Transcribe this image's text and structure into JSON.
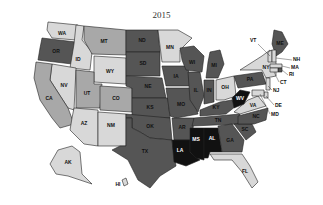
{
  "title": "2015",
  "legend_levels": {
    "black": "#111111",
    "dark": "#555555",
    "medium": "#a8a8a8",
    "light": "#d8d8d8"
  },
  "states": [
    {
      "abbr": "WA",
      "shade": "light",
      "poly": "48,22 78,25 76,40 52,38 47,30",
      "lx": 62,
      "ly": 34
    },
    {
      "abbr": "OR",
      "shade": "dark",
      "poly": "42,38 76,42 72,64 38,60 40,48",
      "lx": 56,
      "ly": 52
    },
    {
      "abbr": "ID",
      "shade": "light",
      "poly": "76,25 84,26 82,40 92,52 90,70 70,68 74,44",
      "lx": 78,
      "ly": 60
    },
    {
      "abbr": "MT",
      "shade": "medium",
      "poly": "84,26 126,30 126,55 92,54 84,40",
      "lx": 104,
      "ly": 42
    },
    {
      "abbr": "WY",
      "shade": "light",
      "poly": "94,56 126,58 126,84 94,82",
      "lx": 110,
      "ly": 72
    },
    {
      "abbr": "NV",
      "shade": "light",
      "poly": "52,64 76,68 74,110 68,108 50,80",
      "lx": 64,
      "ly": 86
    },
    {
      "abbr": "CA",
      "shade": "medium",
      "poly": "36,62 52,64 50,80 68,108 74,124 60,128 52,118 40,100 34,78",
      "lx": 49,
      "ly": 99
    },
    {
      "abbr": "UT",
      "shade": "medium",
      "poly": "76,70 94,72 94,84 102,84 100,108 76,108",
      "lx": 87,
      "ly": 94
    },
    {
      "abbr": "CO",
      "shade": "medium",
      "poly": "100,86 132,88 132,112 100,110",
      "lx": 116,
      "ly": 99
    },
    {
      "abbr": "AZ",
      "shade": "light",
      "poly": "74,108 98,110 98,146 84,144 70,130 72,118",
      "lx": 84,
      "ly": 124
    },
    {
      "abbr": "NM",
      "shade": "light",
      "poly": "98,112 126,114 126,146 98,146",
      "lx": 111,
      "ly": 126
    },
    {
      "abbr": "ND",
      "shade": "dark",
      "poly": "126,30 158,30 160,52 126,52",
      "lx": 142,
      "ly": 41
    },
    {
      "abbr": "SD",
      "shade": "dark",
      "poly": "126,52 160,52 160,76 126,76",
      "lx": 143,
      "ly": 64
    },
    {
      "abbr": "NE",
      "shade": "dark",
      "poly": "126,76 162,78 166,98 132,98 132,88 126,86",
      "lx": 148,
      "ly": 87
    },
    {
      "abbr": "KS",
      "shade": "dark",
      "poly": "132,98 168,98 170,118 132,118",
      "lx": 150,
      "ly": 108
    },
    {
      "abbr": "OK",
      "shade": "dark",
      "poly": "126,114 170,118 172,140 150,138 140,132 132,128 132,118 126,118",
      "lx": 150,
      "ly": 127
    },
    {
      "abbr": "TX",
      "shade": "dark",
      "poly": "126,118 132,118 132,128 140,132 150,138 172,140 176,166 160,176 150,188 138,180 128,160 112,150 120,146 126,146",
      "lx": 145,
      "ly": 152
    },
    {
      "abbr": "MN",
      "shade": "light",
      "poly": "158,30 178,30 192,38 180,50 180,62 162,62",
      "lx": 170,
      "ly": 48
    },
    {
      "abbr": "IA",
      "shade": "dark",
      "poly": "162,66 188,66 190,86 166,86",
      "lx": 176,
      "ly": 77
    },
    {
      "abbr": "MO",
      "shade": "dark",
      "poly": "166,88 190,88 198,114 176,118 170,116",
      "lx": 181,
      "ly": 105
    },
    {
      "abbr": "AR",
      "shade": "dark",
      "poly": "172,118 194,118 192,140 174,140",
      "lx": 182,
      "ly": 128
    },
    {
      "abbr": "LA",
      "shade": "black",
      "poly": "172,140 190,140 190,152 200,160 186,166 174,162",
      "lx": 180,
      "ly": 151
    },
    {
      "abbr": "WI",
      "shade": "dark",
      "poly": "180,48 194,46 204,56 202,72 186,70 182,60",
      "lx": 192,
      "ly": 63
    },
    {
      "abbr": "IL",
      "shade": "dark",
      "poly": "188,72 200,72 204,96 198,112 190,100",
      "lx": 196,
      "ly": 91
    },
    {
      "abbr": "MI",
      "shade": "dark",
      "poly": "210,52 220,50 224,64 218,78 206,78 208,62",
      "lx": 214,
      "ly": 66
    },
    {
      "abbr": "IN",
      "shade": "dark",
      "poly": "204,80 214,80 214,102 204,104",
      "lx": 209,
      "ly": 91
    },
    {
      "abbr": "OH",
      "shade": "light",
      "poly": "216,80 234,76 236,96 224,100 216,100",
      "lx": 225,
      "ly": 88
    },
    {
      "abbr": "KY",
      "shade": "dark",
      "poly": "200,110 220,102 232,100 236,106 226,114 200,116",
      "lx": 216,
      "ly": 108
    },
    {
      "abbr": "TN",
      "shade": "dark",
      "poly": "194,118 240,114 238,124 192,126",
      "lx": 218,
      "ly": 121
    },
    {
      "abbr": "MS",
      "shade": "black",
      "poly": "190,128 204,128 204,160 196,158 190,152",
      "lx": 196,
      "ly": 140
    },
    {
      "abbr": "AL",
      "shade": "black",
      "poly": "204,128 218,128 222,152 210,152 208,158 204,158",
      "lx": 212,
      "ly": 139
    },
    {
      "abbr": "GA",
      "shade": "dark",
      "poly": "218,126 232,124 244,140 242,152 222,152",
      "lx": 230,
      "ly": 141
    },
    {
      "abbr": "FL",
      "shade": "light",
      "poly": "210,154 242,154 250,166 258,182 252,188 242,172 232,160 214,160",
      "lx": 245,
      "ly": 172
    },
    {
      "abbr": "SC",
      "shade": "dark",
      "poly": "234,124 252,124 256,132 246,140",
      "lx": 245,
      "ly": 130
    },
    {
      "abbr": "NC",
      "shade": "dark",
      "poly": "238,116 268,108 266,120 254,124 238,124",
      "lx": 256,
      "ly": 117
    },
    {
      "abbr": "VA",
      "shade": "light",
      "poly": "234,112 248,100 258,96 266,106 240,114",
      "lx": 253,
      "ly": 106
    },
    {
      "abbr": "WV",
      "shade": "black",
      "poly": "232,98 240,90 250,92 244,104 234,108",
      "lx": 240,
      "ly": 99
    },
    {
      "abbr": "PA",
      "shade": "dark",
      "poly": "234,76 262,72 266,84 238,88",
      "lx": 250,
      "ly": 80
    },
    {
      "abbr": "NY",
      "shade": "light",
      "poly": "240,70 262,56 270,50 276,62 276,76 266,78 262,70",
      "lx": 266,
      "ly": 68
    },
    {
      "abbr": "ME",
      "shade": "dark",
      "poly": "274,30 282,32 288,44 282,52 276,56 272,44",
      "lx": 280,
      "ly": 44
    },
    {
      "abbr": "VT",
      "shade": "light",
      "poly": "268,52 272,50 272,62 268,62",
      "lx": 0,
      "ly": 0
    },
    {
      "abbr": "NH",
      "shade": "light",
      "poly": "272,50 276,50 276,62 272,62",
      "lx": 0,
      "ly": 0
    },
    {
      "abbr": "MA",
      "shade": "light",
      "poly": "270,64 282,64 282,68 270,68",
      "lx": 0,
      "ly": 0
    },
    {
      "abbr": "RI",
      "shade": "dark",
      "poly": "278,68 282,68 282,72 278,72",
      "lx": 0,
      "ly": 0
    },
    {
      "abbr": "CT",
      "shade": "light",
      "poly": "270,68 278,68 278,72 270,72",
      "lx": 0,
      "ly": 0
    },
    {
      "abbr": "NJ",
      "shade": "light",
      "poly": "266,78 270,78 270,90 266,90",
      "lx": 0,
      "ly": 0
    },
    {
      "abbr": "DE",
      "shade": "light",
      "poly": "264,92 268,92 268,98 264,98",
      "lx": 0,
      "ly": 0
    },
    {
      "abbr": "MD",
      "shade": "light",
      "poly": "252,90 264,90 264,96 252,96",
      "lx": 0,
      "ly": 0
    },
    {
      "abbr": "AK",
      "shade": "light",
      "poly": "58,150 72,146 80,152 82,174 92,184 80,180 68,176 56,174 50,164",
      "lx": 68,
      "ly": 163
    },
    {
      "abbr": "HI",
      "shade": "light",
      "poly": "122,180 126,178 128,184 124,186",
      "lx": 118,
      "ly": 185
    }
  ],
  "external_labels": [
    {
      "abbr": "VT",
      "tx": 250,
      "ty": 42,
      "x1": 258,
      "y1": 44,
      "x2": 270,
      "y2": 56
    },
    {
      "abbr": "NH",
      "tx": 293,
      "ty": 61,
      "x1": 292,
      "y1": 60,
      "x2": 276,
      "y2": 58
    },
    {
      "abbr": "MA",
      "tx": 291,
      "ty": 69,
      "x1": 290,
      "y1": 68,
      "x2": 282,
      "y2": 66
    },
    {
      "abbr": "RI",
      "tx": 289,
      "ty": 76,
      "x1": 288,
      "y1": 75,
      "x2": 282,
      "y2": 70
    },
    {
      "abbr": "CT",
      "tx": 280,
      "ty": 84,
      "x1": 279,
      "y1": 82,
      "x2": 274,
      "y2": 72
    },
    {
      "abbr": "NJ",
      "tx": 273,
      "ty": 92,
      "x1": 272,
      "y1": 90,
      "x2": 268,
      "y2": 86
    },
    {
      "abbr": "DE",
      "tx": 275,
      "ty": 107,
      "x1": 274,
      "y1": 105,
      "x2": 266,
      "y2": 96
    },
    {
      "abbr": "MD",
      "tx": 271,
      "ty": 116,
      "x1": 270,
      "y1": 114,
      "x2": 260,
      "y2": 94
    }
  ]
}
